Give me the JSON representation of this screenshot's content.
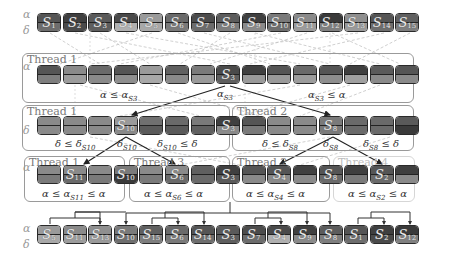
{
  "axes": {
    "alpha": "α",
    "delta": "δ"
  },
  "rows": {
    "top": {
      "labels": [
        "S1",
        "S2",
        "S3",
        "S4",
        "S5",
        "S6",
        "S7",
        "S8",
        "S9",
        "S10",
        "S11",
        "S12",
        "S13",
        "S14",
        "S15"
      ],
      "alpha_colors": [
        "#555555",
        "#3f3f3f",
        "#5a5a5a",
        "#4a4a4a",
        "#9a9a9a",
        "#6a6a6a",
        "#4c4c4c",
        "#5c5c5c",
        "#404040",
        "#7a7a7a",
        "#8a8a8a",
        "#3a3a3a",
        "#8f8f8f",
        "#555555",
        "#606060"
      ],
      "delta_colors": [
        "#6d6d6d",
        "#4a4a4a",
        "#5e5e5e",
        "#b0b0b0",
        "#a8a8a8",
        "#7a7a7a",
        "#6c6c6c",
        "#7e7e7e",
        "#8a8a8a",
        "#6e6e6e",
        "#9c9c9c",
        "#808080",
        "#9a9a9a",
        "#6e6e6e",
        "#7e7e7e"
      ]
    },
    "level1": {
      "labels": [
        "",
        "",
        "",
        "",
        "",
        "",
        "",
        "S3",
        "",
        "",
        "",
        "",
        "",
        "",
        ""
      ],
      "alpha_colors": [
        "#555555",
        "#8a8a8a",
        "#6a6a6a",
        "#555555",
        "#9a9a9a",
        "#606060",
        "#7a7a7a",
        "#4a4a4a",
        "#404040",
        "#555555",
        "#6a6a6a",
        "#555555",
        "#3f3f3f",
        "#5a5a5a",
        "#555555"
      ],
      "delta_colors": [
        "#7e7e7e",
        "#9c9c9c",
        "#8a8a8a",
        "#8e8e8e",
        "#a8a8a8",
        "#8a8a8a",
        "#9a9a9a",
        "#5e5e5e",
        "#9a9a9a",
        "#9a9a9a",
        "#9c9c9c",
        "#8e8e8e",
        "#a0a0a0",
        "#8a8a8a",
        "#8a8a8a"
      ]
    },
    "level2": {
      "labels": [
        "",
        "",
        "",
        "S10",
        "",
        "",
        "",
        "S3",
        "",
        "",
        "",
        "S8",
        "",
        "",
        ""
      ],
      "alpha_colors": [
        "#8a8a8a",
        "#8a8a8a",
        "#8a8a8a",
        "#9a9a9a",
        "#707070",
        "#6a6a6a",
        "#7a7a7a",
        "#404040",
        "#555555",
        "#8a8a8a",
        "#8a8a8a",
        "#7a7a7a",
        "#6a6a6a",
        "#6a6a6a",
        "#5a5a5a"
      ],
      "delta_colors": [
        "#8a8a8a",
        "#8a8a8a",
        "#8a8a8a",
        "#8a8a8a",
        "#5a5a5a",
        "#5a5a5a",
        "#606060",
        "#8a8a8a",
        "#7a7a7a",
        "#8a8a8a",
        "#8a8a8a",
        "#7a7a7a",
        "#6a6a6a",
        "#6a6a6a",
        "#3a3a3a"
      ]
    },
    "level3": {
      "labels": [
        "",
        "S11",
        "",
        "S10",
        "",
        "S6",
        "",
        "S3",
        "",
        "S4",
        "",
        "S8",
        "",
        "S2",
        ""
      ],
      "alpha_colors": [
        "#8a8a8a",
        "#8a8a8a",
        "#8a8a8a",
        "#7a7a7a",
        "#8a8a8a",
        "#8a8a8a",
        "#606060",
        "#404040",
        "#555555",
        "#555555",
        "#404040",
        "#555555",
        "#3f3f3f",
        "#555555",
        "#3f3f3f"
      ],
      "delta_colors": [
        "#7a7a7a",
        "#6a6a6a",
        "#7a7a7a",
        "#3a3a3a",
        "#7a7a7a",
        "#6a6a6a",
        "#6a6a6a",
        "#5a5a5a",
        "#8a8a8a",
        "#8a8a8a",
        "#8a8a8a",
        "#6a6a6a",
        "#7a7a7a",
        "#6a6a6a",
        "#8a8a8a"
      ]
    },
    "bottom": {
      "labels": [
        "S5",
        "S11",
        "S13",
        "S10",
        "S15",
        "S6",
        "S14",
        "S3",
        "S7",
        "S4",
        "S9",
        "S8",
        "S1",
        "S2",
        "S12"
      ],
      "alpha_colors": [
        "#9a9a9a",
        "#8a8a8a",
        "#8f8f8f",
        "#7a7a7a",
        "#606060",
        "#6a6a6a",
        "#555555",
        "#5a5a5a",
        "#4c4c4c",
        "#4a4a4a",
        "#404040",
        "#5c5c5c",
        "#555555",
        "#3f3f3f",
        "#3a3a3a"
      ],
      "delta_colors": [
        "#a8a8a8",
        "#9c9c9c",
        "#9a9a9a",
        "#6e6e6e",
        "#7e7e7e",
        "#7a7a7a",
        "#6e6e6e",
        "#5e5e5e",
        "#6c6c6c",
        "#b0b0b0",
        "#8a8a8a",
        "#7e7e7e",
        "#6d6d6d",
        "#4a4a4a",
        "#808080"
      ]
    }
  },
  "boxes": {
    "thread1_top": {
      "title": "Thread 1",
      "cond_left": "α ≤ α",
      "cond_left_sub": "S3",
      "pivot": "α",
      "pivot_sub": "S3",
      "cond_right": "α",
      "cond_right_sub": "S3",
      "cond_right_tail": " ≤ α"
    },
    "thread1_mid": {
      "title": "Thread 1",
      "cond_left": "δ ≤ δ",
      "cond_left_sub": "S10",
      "pivot": "δ",
      "pivot_sub": "S10",
      "cond_right": "δ",
      "cond_right_sub": "S10",
      "cond_right_tail": " ≤ δ"
    },
    "thread2_mid": {
      "title": "Thread 2",
      "cond_left": "δ ≤ δ",
      "cond_left_sub": "S8",
      "pivot": "δ",
      "pivot_sub": "S8",
      "cond_right": "δ",
      "cond_right_sub": "S8",
      "cond_right_tail": " ≤ δ"
    },
    "thread1_low": {
      "title": "Thread 1",
      "cond": "α ≤ α",
      "cond_sub": "S11",
      "cond_tail": " ≤ α"
    },
    "thread3_low": {
      "title": "Thread 3",
      "cond": "α ≤ α",
      "cond_sub": "S6",
      "cond_tail": " ≤ α"
    },
    "thread2_low": {
      "title": "Thread 2",
      "cond": "α ≤ α",
      "cond_sub": "S4",
      "cond_tail": " ≤ α"
    },
    "thread4_low": {
      "title": "Thread 4",
      "cond": "α ≤ α",
      "cond_sub": "S2",
      "cond_tail": " ≤ α"
    }
  }
}
